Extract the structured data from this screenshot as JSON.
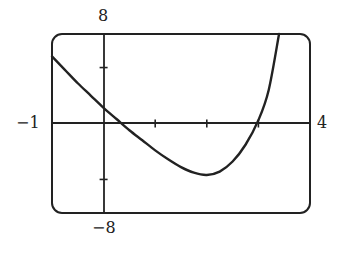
{
  "chart_data": {
    "type": "line",
    "title": "",
    "xlabel": "",
    "ylabel": "",
    "xlim": [
      -1,
      4
    ],
    "ylim": [
      -8,
      8
    ],
    "grid": false,
    "x_ticks": [
      0,
      1,
      2,
      3
    ],
    "y_ticks": [
      -5,
      5
    ],
    "tick_labels": {
      "xmin": "−1",
      "xmax": "4",
      "ymax": "8",
      "ymin": "−8"
    },
    "series": [
      {
        "name": "f(x)",
        "x": [
          -1,
          -0.75,
          -0.5,
          -0.25,
          0,
          0.25,
          0.5,
          0.75,
          1,
          1.25,
          1.5,
          1.75,
          2,
          2.25,
          2.5,
          2.75,
          3,
          3.2,
          3.4
        ],
        "y": [
          6.0,
          4.8,
          3.6,
          2.5,
          1.4,
          0.4,
          -0.6,
          -1.5,
          -2.4,
          -3.2,
          -3.9,
          -4.4,
          -4.6,
          -4.3,
          -3.4,
          -1.9,
          0.3,
          3.0,
          8.0
        ]
      }
    ]
  },
  "labels": {
    "ymax": "8",
    "ymin": "−8",
    "xmin": "−1",
    "xmax": "4"
  },
  "colors": {
    "line": "#222222",
    "background": "#ffffff"
  }
}
